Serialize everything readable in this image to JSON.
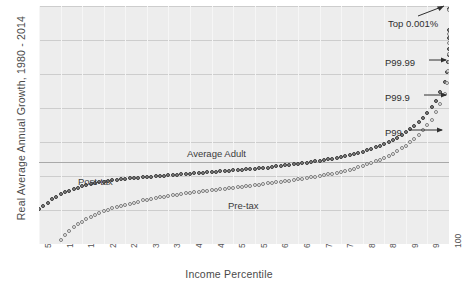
{
  "chart_data": {
    "type": "scatter",
    "title": "",
    "xlabel": "Income Percentile",
    "ylabel": "Real Average Annual Growth, 1980 - 2014",
    "xlim": [
      5,
      100
    ],
    "ylim": [
      -1,
      6
    ],
    "ytick_labels": [
      "6%",
      "5%",
      "4%",
      "3%",
      "2%",
      "1%",
      "0%",
      "-1%"
    ],
    "ytick_values": [
      6,
      5,
      4,
      3,
      2,
      1,
      0,
      -1
    ],
    "xtick_labels": [
      "5",
      "10",
      "15",
      "20",
      "25",
      "30",
      "35",
      "40",
      "45",
      "50",
      "55",
      "60",
      "65",
      "70",
      "75",
      "80",
      "85",
      "90",
      "95",
      "100"
    ],
    "xtick_values": [
      5,
      10,
      15,
      20,
      25,
      30,
      35,
      40,
      45,
      50,
      55,
      60,
      65,
      70,
      75,
      80,
      85,
      90,
      95,
      100
    ],
    "grid": true,
    "legend_position": "inline-labels",
    "reference_lines": [
      {
        "name": "Average Adult",
        "value": 1.4,
        "orientation": "horizontal"
      }
    ],
    "series": [
      {
        "name": "Post-tax",
        "marker": "filled-circle",
        "color": "#8a8a8a",
        "x": [
          5,
          6,
          7,
          8,
          9,
          10,
          11,
          12,
          13,
          14,
          15,
          16,
          17,
          18,
          19,
          20,
          21,
          22,
          23,
          24,
          25,
          26,
          27,
          28,
          29,
          30,
          31,
          32,
          33,
          34,
          35,
          36,
          37,
          38,
          39,
          40,
          41,
          42,
          43,
          44,
          45,
          46,
          47,
          48,
          49,
          50,
          51,
          52,
          53,
          54,
          55,
          56,
          57,
          58,
          59,
          60,
          61,
          62,
          63,
          64,
          65,
          66,
          67,
          68,
          69,
          70,
          71,
          72,
          73,
          74,
          75,
          76,
          77,
          78,
          79,
          80,
          81,
          82,
          83,
          84,
          85,
          86,
          87,
          88,
          89,
          90,
          91,
          92,
          93,
          94,
          95,
          96,
          97,
          98,
          99,
          99.5,
          99.8,
          99.9,
          99.95,
          99.99,
          99.995,
          99.999
        ],
        "y": [
          0.02,
          0.12,
          0.22,
          0.31,
          0.39,
          0.46,
          0.52,
          0.57,
          0.62,
          0.66,
          0.7,
          0.73,
          0.76,
          0.79,
          0.81,
          0.83,
          0.85,
          0.87,
          0.88,
          0.9,
          0.91,
          0.93,
          0.94,
          0.95,
          0.96,
          0.97,
          0.98,
          0.99,
          1.0,
          1.01,
          1.02,
          1.03,
          1.04,
          1.05,
          1.06,
          1.07,
          1.08,
          1.09,
          1.1,
          1.11,
          1.12,
          1.13,
          1.14,
          1.15,
          1.16,
          1.17,
          1.18,
          1.19,
          1.2,
          1.21,
          1.22,
          1.23,
          1.24,
          1.25,
          1.27,
          1.28,
          1.29,
          1.31,
          1.32,
          1.34,
          1.35,
          1.37,
          1.39,
          1.41,
          1.43,
          1.45,
          1.47,
          1.49,
          1.51,
          1.54,
          1.56,
          1.59,
          1.62,
          1.65,
          1.68,
          1.72,
          1.76,
          1.8,
          1.84,
          1.89,
          1.94,
          2.0,
          2.06,
          2.13,
          2.2,
          2.28,
          2.37,
          2.47,
          2.58,
          2.71,
          2.85,
          3.02,
          3.22,
          3.46,
          3.76,
          4.05,
          4.35,
          4.55,
          4.75,
          5.05,
          5.3,
          5.92
        ]
      },
      {
        "name": "Pre-tax",
        "marker": "open-circle",
        "color": "#f2f2f2",
        "x": [
          10,
          11,
          12,
          13,
          14,
          15,
          16,
          17,
          18,
          19,
          20,
          21,
          22,
          23,
          24,
          25,
          26,
          27,
          28,
          29,
          30,
          31,
          32,
          33,
          34,
          35,
          36,
          37,
          38,
          39,
          40,
          41,
          42,
          43,
          44,
          45,
          46,
          47,
          48,
          49,
          50,
          51,
          52,
          53,
          54,
          55,
          56,
          57,
          58,
          59,
          60,
          61,
          62,
          63,
          64,
          65,
          66,
          67,
          68,
          69,
          70,
          71,
          72,
          73,
          74,
          75,
          76,
          77,
          78,
          79,
          80,
          81,
          82,
          83,
          84,
          85,
          86,
          87,
          88,
          89,
          90,
          91,
          92,
          93,
          94,
          95,
          96,
          97,
          98,
          99,
          99.5,
          99.8,
          99.9,
          99.95,
          99.99,
          99.995,
          99.999
        ],
        "y": [
          -0.88,
          -0.74,
          -0.62,
          -0.51,
          -0.42,
          -0.34,
          -0.27,
          -0.2,
          -0.14,
          -0.09,
          -0.04,
          0.01,
          0.05,
          0.09,
          0.12,
          0.16,
          0.19,
          0.22,
          0.25,
          0.28,
          0.3,
          0.33,
          0.35,
          0.37,
          0.39,
          0.41,
          0.43,
          0.45,
          0.47,
          0.49,
          0.5,
          0.52,
          0.54,
          0.55,
          0.57,
          0.58,
          0.6,
          0.61,
          0.63,
          0.64,
          0.66,
          0.67,
          0.69,
          0.7,
          0.72,
          0.73,
          0.75,
          0.76,
          0.78,
          0.79,
          0.81,
          0.83,
          0.84,
          0.86,
          0.88,
          0.9,
          0.92,
          0.94,
          0.96,
          0.98,
          1.0,
          1.02,
          1.05,
          1.07,
          1.1,
          1.13,
          1.16,
          1.19,
          1.22,
          1.26,
          1.3,
          1.34,
          1.38,
          1.43,
          1.48,
          1.54,
          1.6,
          1.66,
          1.73,
          1.81,
          1.89,
          1.99,
          2.09,
          2.21,
          2.34,
          2.49,
          2.66,
          2.87,
          3.12,
          3.42,
          3.74,
          4.1,
          4.34,
          4.58,
          4.92,
          5.18,
          5.88
        ]
      }
    ],
    "annotations": [
      {
        "name": "Top 0.001%",
        "text": "Top 0.001%"
      },
      {
        "name": "P99.99",
        "text": "P99.99"
      },
      {
        "name": "P99.9",
        "text": "P99.9"
      },
      {
        "name": "P99",
        "text": "P99"
      },
      {
        "name": "Average Adult",
        "text": "Average Adult"
      },
      {
        "name": "Post-tax",
        "text": "Post-tax"
      },
      {
        "name": "Pre-tax",
        "text": "Pre-tax"
      }
    ]
  },
  "axes": {
    "y_title": "Real Average Annual Growth, 1980 - 2014",
    "x_title": "Income Percentile"
  },
  "labels": {
    "average_adult": "Average Adult",
    "post_tax": "Post-tax",
    "pre_tax": "Pre-tax",
    "top_0001": "Top 0.001%",
    "p9999": "P99.99",
    "p999": "P99.9",
    "p99": "P99"
  },
  "colors": {
    "plot_background": "#ededed",
    "gridline": "#cdcdcd",
    "post_tax_marker": "#8a8a8a",
    "pre_tax_marker": "#f2f2f2",
    "marker_outline": "#3a3a3a",
    "text": "#3b3b3b"
  }
}
